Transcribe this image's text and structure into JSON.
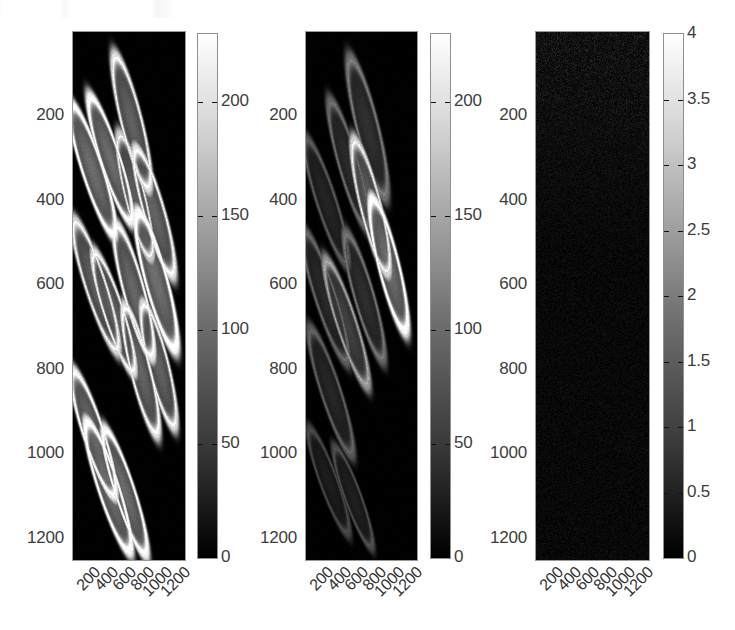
{
  "figure": {
    "background": "#ffffff",
    "panel_count": 3
  },
  "chart_data": {
    "type": "heatmap",
    "title": "",
    "subtitle": "",
    "xlabel": "",
    "ylabel": "",
    "grid": false,
    "legend_position": "right-of-each-panel",
    "shared_axes": {
      "xticks": [
        200,
        400,
        600,
        800,
        1000,
        1200
      ],
      "xtick_labels": [
        "200",
        "400",
        "600",
        "800",
        "1000",
        "1200"
      ],
      "yticks": [
        200,
        400,
        600,
        800,
        1000,
        1200
      ],
      "ytick_labels": [
        "200",
        "400",
        "600",
        "800",
        "1000",
        "1200"
      ],
      "xlim": [
        0,
        1250
      ],
      "ylim": [
        0,
        1250
      ],
      "xtick_rotation": -45
    },
    "panels": [
      {
        "name": "panel-1",
        "colormap": "gray",
        "vmin": 0,
        "vmax": 230,
        "colorbar": {
          "ticks": [
            0,
            50,
            100,
            150,
            200
          ],
          "tick_labels": [
            "0",
            "50",
            "100",
            "150",
            "200"
          ],
          "min_label": "0",
          "max_label": "200"
        },
        "description": "bright elliptical ring structures on black background",
        "features": [
          {
            "cx": 17,
            "cy": 26,
            "rx": 9.5,
            "ry": 13.5,
            "rot": -18,
            "peak": 225
          },
          {
            "cx": 33,
            "cy": 24,
            "rx": 9.0,
            "ry": 13.0,
            "rot": -18,
            "peak": 220
          },
          {
            "cx": 52,
            "cy": 17,
            "rx": 9.5,
            "ry": 13.5,
            "rot": -14,
            "peak": 200
          },
          {
            "cx": 55,
            "cy": 31,
            "rx": 9.0,
            "ry": 12.5,
            "rot": -14,
            "peak": 185
          },
          {
            "cx": 72,
            "cy": 34,
            "rx": 9.5,
            "ry": 13.0,
            "rot": -16,
            "peak": 205
          },
          {
            "cx": 20,
            "cy": 48,
            "rx": 9.5,
            "ry": 13.5,
            "rot": -18,
            "peak": 195
          },
          {
            "cx": 36,
            "cy": 53,
            "rx": 9.0,
            "ry": 12.5,
            "rot": -18,
            "peak": 200
          },
          {
            "cx": 54,
            "cy": 49,
            "rx": 9.5,
            "ry": 13.5,
            "rot": -15,
            "peak": 210
          },
          {
            "cx": 74,
            "cy": 47,
            "rx": 10.0,
            "ry": 14.0,
            "rot": -15,
            "peak": 230
          },
          {
            "cx": 60,
            "cy": 64,
            "rx": 9.0,
            "ry": 13.0,
            "rot": -14,
            "peak": 205
          },
          {
            "cx": 76,
            "cy": 63,
            "rx": 9.0,
            "ry": 12.5,
            "rot": -14,
            "peak": 200
          },
          {
            "cx": 18,
            "cy": 76,
            "rx": 9.5,
            "ry": 13.0,
            "rot": -18,
            "peak": 215
          },
          {
            "cx": 31,
            "cy": 86,
            "rx": 9.5,
            "ry": 13.5,
            "rot": -18,
            "peak": 225
          },
          {
            "cx": 46,
            "cy": 87,
            "rx": 9.0,
            "ry": 13.0,
            "rot": -18,
            "peak": 220
          }
        ]
      },
      {
        "name": "panel-2",
        "colormap": "gray",
        "vmin": 0,
        "vmax": 230,
        "colorbar": {
          "ticks": [
            0,
            50,
            100,
            150,
            200
          ],
          "tick_labels": [
            "0",
            "50",
            "100",
            "150",
            "200"
          ],
          "min_label": "0",
          "max_label": "200"
        },
        "description": "dimmer elliptical structures, fewer bright rings",
        "features": [
          {
            "cx": 55,
            "cy": 18,
            "rx": 10.0,
            "ry": 14.0,
            "rot": -14,
            "peak": 95
          },
          {
            "cx": 38,
            "cy": 25,
            "rx": 9.0,
            "ry": 13.0,
            "rot": -16,
            "peak": 85
          },
          {
            "cx": 18,
            "cy": 32,
            "rx": 9.0,
            "ry": 13.0,
            "rot": -18,
            "peak": 70
          },
          {
            "cx": 58,
            "cy": 33,
            "rx": 9.5,
            "ry": 13.5,
            "rot": -14,
            "peak": 190
          },
          {
            "cx": 74,
            "cy": 44,
            "rx": 9.5,
            "ry": 13.5,
            "rot": -14,
            "peak": 225
          },
          {
            "cx": 17,
            "cy": 50,
            "rx": 9.5,
            "ry": 13.5,
            "rot": -18,
            "peak": 80
          },
          {
            "cx": 36,
            "cy": 55,
            "rx": 9.0,
            "ry": 13.0,
            "rot": -18,
            "peak": 130
          },
          {
            "cx": 52,
            "cy": 50,
            "rx": 9.0,
            "ry": 13.0,
            "rot": -16,
            "peak": 90
          },
          {
            "cx": 22,
            "cy": 68,
            "rx": 9.0,
            "ry": 13.0,
            "rot": -18,
            "peak": 75
          },
          {
            "cx": 20,
            "cy": 85,
            "rx": 8.0,
            "ry": 11.0,
            "rot": -20,
            "peak": 55
          },
          {
            "cx": 42,
            "cy": 88,
            "rx": 7.5,
            "ry": 10.5,
            "rot": -20,
            "peak": 60
          }
        ]
      },
      {
        "name": "panel-3",
        "colormap": "gray",
        "vmin": 0,
        "vmax": 4,
        "colorbar": {
          "ticks": [
            0,
            0.5,
            1,
            1.5,
            2,
            2.5,
            3,
            3.5,
            4
          ],
          "tick_labels": [
            "0",
            "0.5",
            "1",
            "1.5",
            "2",
            "2.5",
            "3",
            "3.5",
            "4"
          ],
          "min_label": "0",
          "max_label": "4"
        },
        "description": "near-uniform black residual / noise map with very faint speckle in upper region",
        "features": []
      }
    ]
  }
}
